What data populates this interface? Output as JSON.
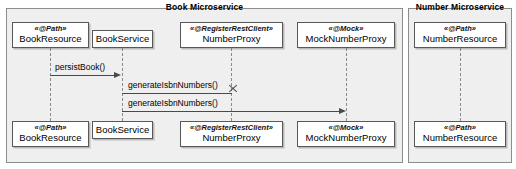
{
  "diagram": {
    "type": "uml-sequence-diagram",
    "frames": [
      {
        "id": "book",
        "title": "Book Microservice"
      },
      {
        "id": "number",
        "title": "Number Microservice"
      }
    ],
    "participants": [
      {
        "id": "book-resource-top",
        "stereotype": "«@Path»",
        "name": "BookResource"
      },
      {
        "id": "book-service-top",
        "stereotype": "",
        "name": "BookService"
      },
      {
        "id": "number-proxy-top",
        "stereotype": "«@RegisterRestClient»",
        "name": "NumberProxy"
      },
      {
        "id": "mock-number-proxy-top",
        "stereotype": "«@Mock»",
        "name": "MockNumberProxy"
      },
      {
        "id": "number-resource-top",
        "stereotype": "«@Path»",
        "name": "NumberResource"
      },
      {
        "id": "book-resource-bottom",
        "stereotype": "«@Path»",
        "name": "BookResource"
      },
      {
        "id": "book-service-bottom",
        "stereotype": "",
        "name": "BookService"
      },
      {
        "id": "number-proxy-bottom",
        "stereotype": "«@RegisterRestClient»",
        "name": "NumberProxy"
      },
      {
        "id": "mock-number-proxy-bottom",
        "stereotype": "«@Mock»",
        "name": "MockNumberProxy"
      },
      {
        "id": "number-resource-bottom",
        "stereotype": "«@Path»",
        "name": "NumberResource"
      }
    ],
    "messages": [
      {
        "id": "persist-book",
        "label": "persistBook()",
        "from": "BookResource",
        "to": "BookService",
        "kind": "synchronous"
      },
      {
        "id": "generate-isbn-1",
        "label": "generateIsbnNumbers()",
        "from": "BookService",
        "to": "NumberProxy",
        "kind": "blocked"
      },
      {
        "id": "generate-isbn-2",
        "label": "generateIsbnNumbers()",
        "from": "BookService",
        "to": "MockNumberProxy",
        "kind": "synchronous"
      }
    ],
    "colors": {
      "frame_background": "#efefef",
      "frame_border": "#8d8d8d",
      "box_background": "#ffffff",
      "box_border": "#585858",
      "line": "#4a4a4a",
      "lifeline": "#8a8a8a"
    }
  }
}
